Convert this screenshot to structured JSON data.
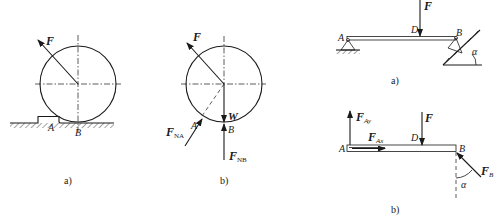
{
  "figures": {
    "left_a": {
      "caption": "a)",
      "labels": {
        "force": "F",
        "point_a": "A",
        "point_b": "B"
      }
    },
    "left_b": {
      "caption": "b)",
      "labels": {
        "force": "F",
        "point_a": "A",
        "point_b": "B",
        "weight": "W",
        "fna_main": "F",
        "fna_sub": "NA",
        "fnb_main": "F",
        "fnb_sub": "NB"
      }
    },
    "right_a": {
      "caption": "a)",
      "labels": {
        "force": "F",
        "point_a": "A",
        "point_b": "B",
        "point_d": "D",
        "angle": "α"
      }
    },
    "right_b": {
      "caption": "b)",
      "labels": {
        "force": "F",
        "point_a": "A",
        "point_b": "B",
        "point_d": "D",
        "angle": "α",
        "fay_main": "F",
        "fay_sub": "Ay",
        "fax_main": "F",
        "fax_sub": "Ax",
        "fb_main": "F",
        "fb_sub": "B"
      }
    }
  },
  "colors": {
    "ink": "#1a1a1a",
    "background": "#ffffff"
  }
}
